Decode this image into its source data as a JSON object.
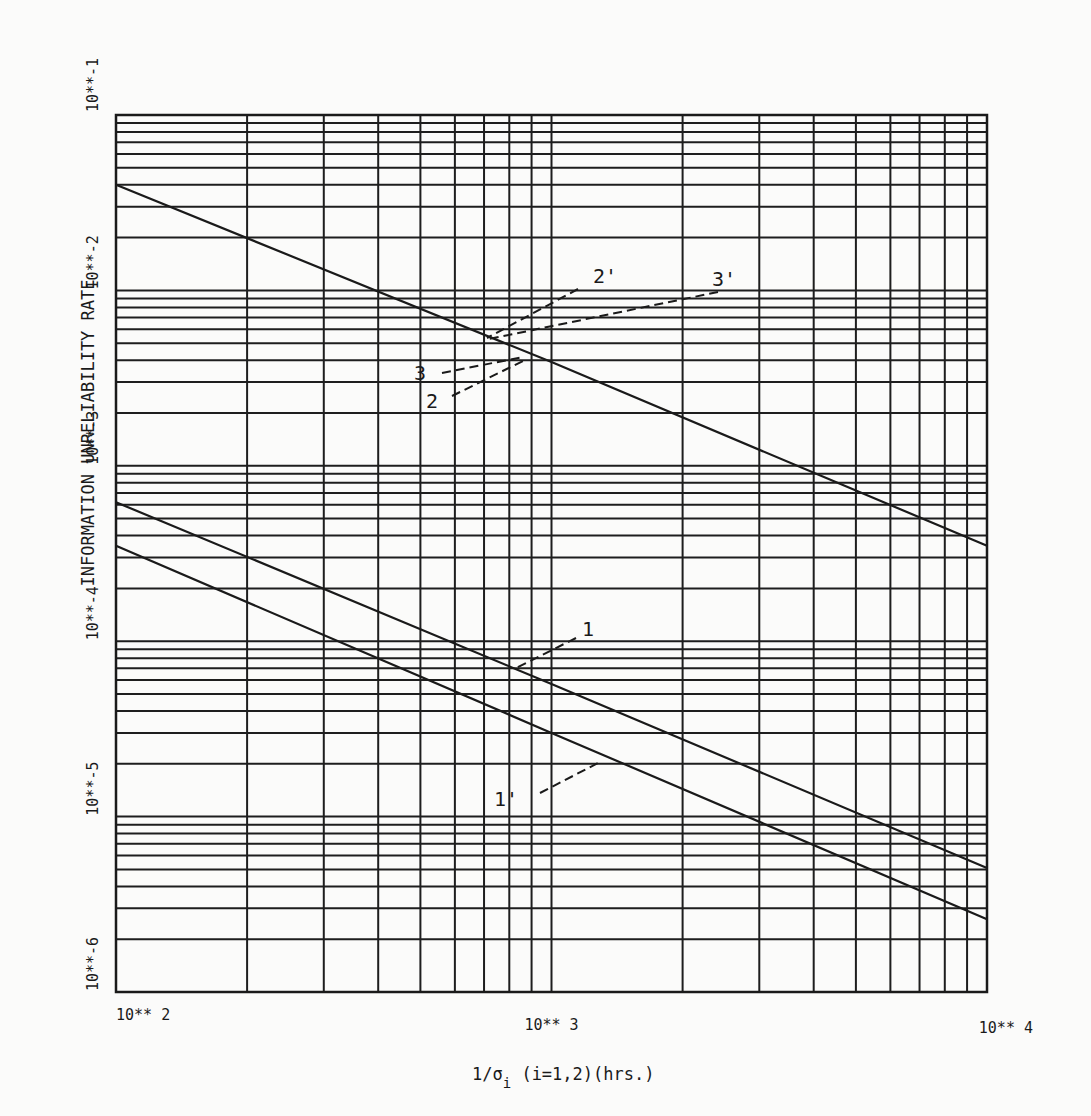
{
  "chart_data": {
    "type": "line",
    "title": "",
    "xlabel": "1/σi (i=1,2)(hrs.)",
    "ylabel": "INFORMATION UNRELIABILITY RATE",
    "xscale": "log",
    "yscale": "log",
    "xlim": [
      100,
      10000
    ],
    "ylim": [
      1e-06,
      0.1
    ],
    "grid": true,
    "legend": null,
    "x_tick_labels": [
      "10** 2",
      "10** 3",
      "10** 4"
    ],
    "x_tick_values": [
      100,
      1000,
      10000
    ],
    "y_tick_labels": [
      "10**-1",
      "10**-2",
      "10**-3",
      "10**-4",
      "10**-5",
      "10**-6"
    ],
    "y_tick_values": [
      0.1,
      0.01,
      0.001,
      0.0001,
      1e-05,
      1e-06
    ],
    "series": [
      {
        "name": "2, 3, 2', 3' (coincident)",
        "x": [
          100,
          1000,
          10000
        ],
        "y": [
          0.04,
          0.0039,
          0.00035
        ]
      },
      {
        "name": "1",
        "x": [
          100,
          1000,
          10000
        ],
        "y": [
          0.00062,
          5.7e-05,
          5.1e-06
        ]
      },
      {
        "name": "1'",
        "x": [
          100,
          1000,
          10000
        ],
        "y": [
          0.00035,
          3e-05,
          2.6e-06
        ]
      }
    ],
    "annotations": [
      {
        "text": "2'",
        "label_at": [
          605,
          283
        ],
        "leader_from": [
          578,
          289
        ],
        "leader_to": [
          487,
          338
        ]
      },
      {
        "text": "3'",
        "label_at": [
          724,
          286
        ],
        "leader_from": [
          718,
          292
        ],
        "leader_to": [
          489,
          339
        ]
      },
      {
        "text": "3",
        "label_at": [
          420,
          380
        ],
        "leader_from": [
          442,
          373
        ],
        "leader_to": [
          523,
          357
        ]
      },
      {
        "text": "2",
        "label_at": [
          432,
          408
        ],
        "leader_from": [
          452,
          396
        ],
        "leader_to": [
          525,
          360
        ]
      },
      {
        "text": "1",
        "label_at": [
          588,
          636
        ],
        "leader_from": [
          576,
          638
        ],
        "leader_to": [
          514,
          669
        ]
      },
      {
        "text": "1'",
        "label_at": [
          506,
          806
        ],
        "leader_from": [
          540,
          793
        ],
        "leader_to": [
          598,
          763
        ]
      }
    ]
  },
  "axes": {
    "x_title_main": "1/σ",
    "x_title_sub": "i",
    "x_title_rest": " (i=1,2)(hrs.)",
    "y_title": "INFORMATION UNRELIABILITY RATE"
  }
}
